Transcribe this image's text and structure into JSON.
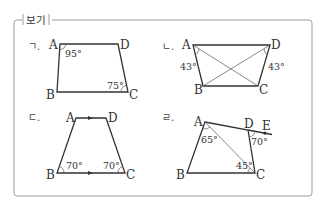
{
  "box": {
    "title": "보기",
    "border_color": "#9a9a9a"
  },
  "figures": [
    {
      "marker": "ㄱ.",
      "vertices": {
        "A": "A",
        "B": "B",
        "C": "C",
        "D": "D"
      },
      "angles": {
        "A": "95°",
        "C": "75°"
      }
    },
    {
      "marker": "ㄴ.",
      "vertices": {
        "A": "A",
        "B": "B",
        "C": "C",
        "D": "D"
      },
      "angles": {
        "left": "43°",
        "right": "43°"
      }
    },
    {
      "marker": "ㄷ.",
      "vertices": {
        "A": "A",
        "B": "B",
        "C": "C",
        "D": "D"
      },
      "angles": {
        "B": "70°",
        "C": "70°"
      }
    },
    {
      "marker": "ㄹ.",
      "vertices": {
        "A": "A",
        "B": "B",
        "C": "C",
        "D": "D",
        "E": "E"
      },
      "angles": {
        "A": "65°",
        "C": "45°",
        "D": "70°"
      }
    }
  ]
}
